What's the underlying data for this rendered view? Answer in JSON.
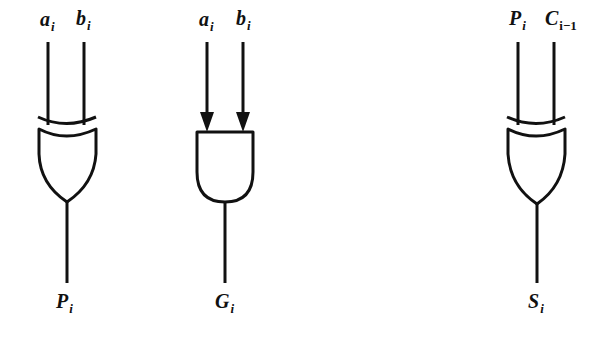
{
  "diagram": {
    "type": "logic-gates",
    "background": "#ffffff",
    "stroke_color": "#111111",
    "gates": [
      {
        "id": "xor-propagate",
        "gate_type": "XOR",
        "inputs": [
          {
            "name": "a",
            "sub": "i"
          },
          {
            "name": "b",
            "sub": "i"
          }
        ],
        "output": {
          "name": "P",
          "sub": "i"
        },
        "input_arrows": false
      },
      {
        "id": "and-generate",
        "gate_type": "AND",
        "inputs": [
          {
            "name": "a",
            "sub": "i"
          },
          {
            "name": "b",
            "sub": "i"
          }
        ],
        "output": {
          "name": "G",
          "sub": "i"
        },
        "input_arrows": true
      },
      {
        "id": "xor-sum",
        "gate_type": "XOR",
        "inputs": [
          {
            "name": "P",
            "sub": "i"
          },
          {
            "name": "C",
            "sub": "i−1"
          }
        ],
        "output": {
          "name": "S",
          "sub": "i"
        },
        "input_arrows": false
      }
    ]
  }
}
